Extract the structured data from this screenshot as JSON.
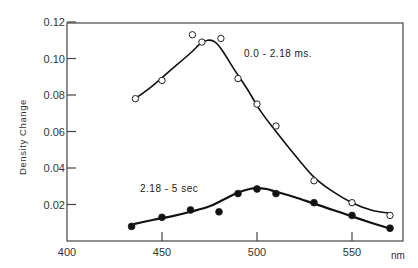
{
  "chart_data": {
    "type": "scatter",
    "title": "",
    "xlabel": "nm",
    "ylabel": "Density Change",
    "xlim": [
      400,
      572
    ],
    "ylim": [
      0,
      0.12
    ],
    "grid": false,
    "legend": "inline annotations",
    "x_ticks": [
      400,
      450,
      500,
      550
    ],
    "y_ticks": [
      0.02,
      0.04,
      0.06,
      0.08,
      0.1,
      0.12
    ],
    "x_tick_labels": [
      "400",
      "450",
      "500",
      "550"
    ],
    "y_tick_labels": [
      "0.02",
      "0.04",
      "0.06",
      "0.08",
      "0.10",
      "0.12"
    ],
    "series": [
      {
        "name": "0.0 - 2.18 ms.",
        "marker": "open-circle",
        "x": [
          436,
          450,
          466,
          471,
          481,
          490,
          500,
          510,
          530,
          550,
          570
        ],
        "values": [
          0.078,
          0.088,
          0.113,
          0.109,
          0.111,
          0.089,
          0.075,
          0.063,
          0.033,
          0.021,
          0.014
        ],
        "fit_curve": {
          "x": [
            436,
            445,
            455,
            465,
            470,
            474,
            478,
            482,
            488,
            495,
            502,
            510,
            520,
            530,
            540,
            550,
            560,
            571
          ],
          "values": [
            0.078,
            0.085,
            0.094,
            0.103,
            0.108,
            0.11,
            0.109,
            0.104,
            0.094,
            0.083,
            0.071,
            0.06,
            0.047,
            0.035,
            0.027,
            0.021,
            0.017,
            0.015
          ]
        }
      },
      {
        "name": "2.18 - 5 sec",
        "marker": "filled-circle",
        "x": [
          434,
          450,
          465,
          480,
          490,
          500,
          510,
          530,
          550,
          570
        ],
        "values": [
          0.008,
          0.013,
          0.017,
          0.016,
          0.026,
          0.0285,
          0.026,
          0.021,
          0.014,
          0.007
        ],
        "fit_curve": {
          "x": [
            434,
            445,
            455,
            465,
            475,
            483,
            490,
            496,
            500,
            505,
            510,
            520,
            530,
            540,
            550,
            560,
            571
          ],
          "values": [
            0.009,
            0.0115,
            0.0135,
            0.016,
            0.019,
            0.023,
            0.0265,
            0.0285,
            0.029,
            0.0285,
            0.027,
            0.024,
            0.0205,
            0.017,
            0.0135,
            0.01,
            0.0065
          ]
        }
      }
    ],
    "annotations": [
      {
        "text": "0.0 - 2.18 ms.",
        "x": 505,
        "y": 0.103
      },
      {
        "text": "2.18 - 5 sec",
        "x": 439,
        "y": 0.029
      }
    ]
  },
  "labels": {
    "ylabel": "Density Change",
    "xunit": "nm",
    "ann_open": "0.0 - 2.18 ms.",
    "ann_filled": "2.18 - 5 sec"
  }
}
